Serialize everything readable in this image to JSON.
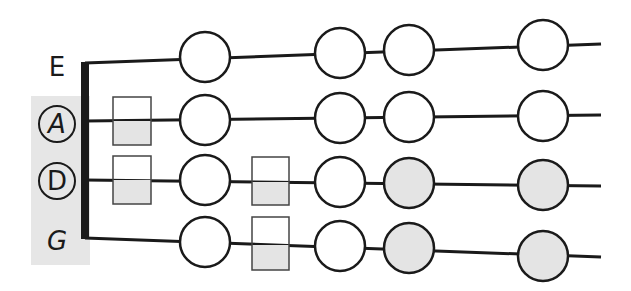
{
  "diagram": {
    "type": "string-fingerboard",
    "colors": {
      "line": "#1a1a1a",
      "panel": "#e6e6e6",
      "filled_note": "#e4e4e4",
      "empty_note": "#ffffff"
    },
    "strings": [
      {
        "name": "E",
        "circled": false,
        "highlighted": false
      },
      {
        "name": "A",
        "circled": true,
        "highlighted": true
      },
      {
        "name": "D",
        "circled": true,
        "highlighted": true
      },
      {
        "name": "G",
        "circled": false,
        "highlighted": false
      }
    ],
    "notes": {
      "E": [
        {
          "type": "circle",
          "filled": false
        },
        {
          "type": "circle",
          "filled": false
        },
        {
          "type": "circle",
          "filled": false
        },
        {
          "type": "circle",
          "filled": false
        }
      ],
      "A": [
        {
          "type": "square",
          "filled": "bottom-half"
        },
        {
          "type": "circle",
          "filled": false
        },
        {
          "type": "circle",
          "filled": false
        },
        {
          "type": "circle",
          "filled": false
        },
        {
          "type": "circle",
          "filled": false
        }
      ],
      "D": [
        {
          "type": "square",
          "filled": "bottom-half"
        },
        {
          "type": "circle",
          "filled": false
        },
        {
          "type": "square",
          "filled": "bottom-half"
        },
        {
          "type": "circle",
          "filled": false
        },
        {
          "type": "circle",
          "filled": true
        },
        {
          "type": "circle",
          "filled": true
        }
      ],
      "G": [
        {
          "type": "circle",
          "filled": false
        },
        {
          "type": "square",
          "filled": "bottom-half"
        },
        {
          "type": "circle",
          "filled": false
        },
        {
          "type": "circle",
          "filled": true
        },
        {
          "type": "circle",
          "filled": true
        }
      ]
    }
  }
}
